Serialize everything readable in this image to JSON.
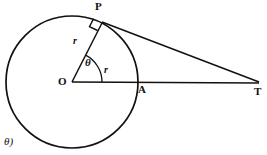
{
  "figure": {
    "type": "geometry-diagram",
    "width": 267,
    "height": 155,
    "background_color": "#ffffff",
    "stroke_color": "#111111"
  },
  "labels": {
    "point_p": "P",
    "point_o": "O",
    "point_a": "A",
    "point_t": "T",
    "radius_radial": "r",
    "radius_horizontal": "r",
    "angle_theta": "θ",
    "corner_note": "θ)"
  },
  "geometry": {
    "circle": {
      "center_x": 72,
      "center_y": 82,
      "radius": 66,
      "stroke_width": 1.6
    },
    "points": {
      "O": {
        "x": 72,
        "y": 82,
        "name": "center"
      },
      "P": {
        "x": 102,
        "y": 23,
        "name": "tangent-point"
      },
      "A": {
        "x": 138,
        "y": 82,
        "name": "circle-horizontal-intersection"
      },
      "T": {
        "x": 259,
        "y": 83,
        "name": "external-point"
      }
    },
    "segments": [
      {
        "name": "radius-OP",
        "from": "O",
        "to": "P",
        "label": "r"
      },
      {
        "name": "radius-OA-extended-OT",
        "from": "O",
        "to": "T",
        "label": "r"
      },
      {
        "name": "tangent-PT",
        "from": "P",
        "to": "T",
        "label": ""
      }
    ],
    "angle_arc": {
      "vertex": "O",
      "start_deg": 0,
      "end_deg": 63,
      "radius": 30,
      "label": "θ"
    },
    "right_angle_marker": {
      "at": "P",
      "size": 9
    }
  }
}
